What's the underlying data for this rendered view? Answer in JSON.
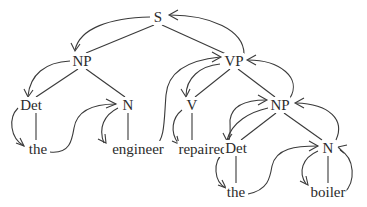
{
  "diagram": {
    "type": "parse-tree-with-traversal-arrows",
    "nodes": {
      "s": {
        "label": "S",
        "x": 158,
        "y": 17
      },
      "np1": {
        "label": "NP",
        "x": 82,
        "y": 61
      },
      "vp": {
        "label": "VP",
        "x": 234,
        "y": 61
      },
      "det1": {
        "label": "Det",
        "x": 31,
        "y": 105
      },
      "n1": {
        "label": "N",
        "x": 128,
        "y": 105
      },
      "v": {
        "label": "V",
        "x": 192,
        "y": 105
      },
      "np2": {
        "label": "NP",
        "x": 280,
        "y": 105
      },
      "the1": {
        "label": "the",
        "x": 38,
        "y": 149
      },
      "engineer": {
        "label": "engineer",
        "x": 138,
        "y": 149
      },
      "repaired": {
        "label": "repaired",
        "x": 203,
        "y": 149
      },
      "det2": {
        "label": "Det",
        "x": 236,
        "y": 148
      },
      "n2": {
        "label": "N",
        "x": 328,
        "y": 148
      },
      "the2": {
        "label": "the",
        "x": 236,
        "y": 192
      },
      "boiler": {
        "label": "boiler",
        "x": 328,
        "y": 192
      }
    },
    "edges": [
      [
        "s",
        "np1"
      ],
      [
        "s",
        "vp"
      ],
      [
        "np1",
        "det1"
      ],
      [
        "np1",
        "n1"
      ],
      [
        "det1",
        "the1"
      ],
      [
        "n1",
        "engineer"
      ],
      [
        "vp",
        "v"
      ],
      [
        "vp",
        "np2"
      ],
      [
        "v",
        "repaired"
      ],
      [
        "np2",
        "det2"
      ],
      [
        "np2",
        "n2"
      ],
      [
        "det2",
        "the2"
      ],
      [
        "n2",
        "boiler"
      ]
    ],
    "colors": {
      "line": "#3a3a3a",
      "text": "#2b2b2b",
      "background": "#ffffff"
    }
  }
}
